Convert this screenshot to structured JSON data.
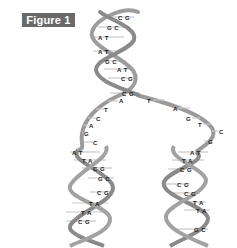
{
  "figure": {
    "badge": "Figure 1",
    "colors": {
      "badge_bg": "#6a6a6a",
      "strand": "#9a9a9a",
      "strand_dark": "#7a7a7a",
      "rung": "#c4c4c4",
      "label": "#222222"
    }
  },
  "parent_helix": {
    "pairs": [
      {
        "label": "C G",
        "x": 118,
        "y": 15
      },
      {
        "label": "G C",
        "x": 107,
        "y": 25
      },
      {
        "label": "A T",
        "x": 98,
        "y": 35
      },
      {
        "label": "A T",
        "x": 98,
        "y": 49
      },
      {
        "label": "G C",
        "x": 105,
        "y": 59
      },
      {
        "label": "A T",
        "x": 117,
        "y": 67
      },
      {
        "label": "C G",
        "x": 121,
        "y": 76
      },
      {
        "label": "C G",
        "x": 122,
        "y": 91
      }
    ]
  },
  "left_unzipped": {
    "bases": [
      {
        "label": "A",
        "x": 119,
        "y": 98
      },
      {
        "label": "T",
        "x": 104,
        "y": 107
      },
      {
        "label": "C",
        "x": 96,
        "y": 116
      },
      {
        "label": "A",
        "x": 89,
        "y": 123
      },
      {
        "label": "G",
        "x": 84,
        "y": 131
      },
      {
        "label": "C",
        "x": 94,
        "y": 140
      },
      {
        "label": "C",
        "x": 95,
        "y": 140
      }
    ]
  },
  "right_unzipped": {
    "bases": [
      {
        "label": "T",
        "x": 147,
        "y": 98
      },
      {
        "label": "A",
        "x": 173,
        "y": 106
      },
      {
        "label": "G",
        "x": 186,
        "y": 116
      },
      {
        "label": "T",
        "x": 198,
        "y": 122
      },
      {
        "label": "C",
        "x": 219,
        "y": 129
      },
      {
        "label": "G",
        "x": 208,
        "y": 139
      }
    ]
  },
  "left_daughter": {
    "pairs": [
      {
        "label": "C",
        "x": 93,
        "y": 140
      },
      {
        "label": "A T",
        "x": 72,
        "y": 150
      },
      {
        "label": "T A",
        "x": 82,
        "y": 158
      },
      {
        "label": "C G",
        "x": 93,
        "y": 166
      },
      {
        "label": "G C",
        "x": 98,
        "y": 176
      },
      {
        "label": "C G",
        "x": 97,
        "y": 190
      },
      {
        "label": "T A",
        "x": 89,
        "y": 201
      },
      {
        "label": "T A",
        "x": 81,
        "y": 210
      },
      {
        "label": "C G",
        "x": 78,
        "y": 219
      }
    ]
  },
  "right_daughter": {
    "pairs": [
      {
        "label": "A T",
        "x": 190,
        "y": 150
      },
      {
        "label": "T A",
        "x": 182,
        "y": 158
      },
      {
        "label": "C G",
        "x": 180,
        "y": 167
      },
      {
        "label": "C G",
        "x": 177,
        "y": 182
      },
      {
        "label": "C G",
        "x": 184,
        "y": 191
      },
      {
        "label": "T A",
        "x": 193,
        "y": 200
      },
      {
        "label": "T A",
        "x": 196,
        "y": 208
      },
      {
        "label": "G C",
        "x": 194,
        "y": 227
      }
    ]
  }
}
